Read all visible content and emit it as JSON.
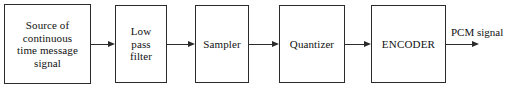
{
  "diagram": {
    "type": "block-diagram",
    "width": 518,
    "height": 94,
    "background_color": "#ffffff",
    "stroke_color": "#2b2b2b",
    "text_color": "#111111",
    "blocks": [
      {
        "id": "source",
        "label": "Source of\ncontinuous\ntime message\nsignal",
        "x": 4,
        "y": 4,
        "w": 87,
        "h": 80
      },
      {
        "id": "low-pass-filter",
        "label": "Low\npass\nfilter",
        "x": 115,
        "y": 5,
        "w": 52,
        "h": 78
      },
      {
        "id": "sampler",
        "label": "Sampler",
        "x": 195,
        "y": 5,
        "w": 54,
        "h": 78
      },
      {
        "id": "quantizer",
        "label": "Quantizer",
        "x": 279,
        "y": 5,
        "w": 66,
        "h": 78
      },
      {
        "id": "encoder",
        "label": "ENCODER",
        "x": 371,
        "y": 5,
        "w": 75,
        "h": 78
      }
    ],
    "connectors": [
      {
        "id": "source-to-filter",
        "x": 91,
        "y": 44,
        "length": 24
      },
      {
        "id": "filter-to-sampler",
        "x": 167,
        "y": 44,
        "length": 28
      },
      {
        "id": "sampler-to-quantizer",
        "x": 249,
        "y": 44,
        "length": 30
      },
      {
        "id": "quantizer-to-encoder",
        "x": 345,
        "y": 44,
        "length": 26
      },
      {
        "id": "encoder-output",
        "x": 446,
        "y": 44,
        "length": 33
      }
    ],
    "output_label": {
      "id": "pcm-signal",
      "text": "PCM signal",
      "x": 451,
      "y": 26
    }
  }
}
